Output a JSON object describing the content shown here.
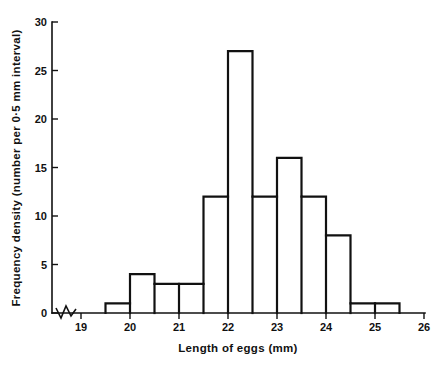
{
  "chart_data": {
    "type": "bar",
    "title": "",
    "subtitle": "",
    "xlabel": "Length of eggs (mm)",
    "ylabel": "Frequency density (number per 0·5 mm interval)",
    "bin_width": 0.5,
    "categories": [
      "19.5-20.0",
      "20.0-20.5",
      "20.5-21.0",
      "21.0-21.5",
      "21.5-22.0",
      "22.0-22.5",
      "22.5-23.0",
      "23.0-23.5",
      "23.5-24.0",
      "24.0-24.5",
      "24.5-25.0",
      "25.0-25.5"
    ],
    "bin_edges": [
      19.5,
      20.0,
      20.5,
      21.0,
      21.5,
      22.0,
      22.5,
      23.0,
      23.5,
      24.0,
      24.5,
      25.0,
      25.5
    ],
    "values": [
      1,
      4,
      3,
      3,
      12,
      27,
      12,
      16,
      12,
      8,
      1,
      1
    ],
    "xlim": [
      19,
      26
    ],
    "ylim": [
      0,
      30
    ],
    "xticks": [
      19,
      20,
      21,
      22,
      23,
      24,
      25,
      26
    ],
    "xtick_labels": [
      "19",
      "20",
      "21",
      "22",
      "23",
      "24",
      "25",
      "26"
    ],
    "yticks": [
      0,
      5,
      10,
      15,
      20,
      25,
      30
    ],
    "ytick_labels": [
      "0",
      "5",
      "10",
      "15",
      "20",
      "25",
      "30"
    ],
    "grid": false,
    "legend": null,
    "axis_break": {
      "present": true,
      "axis": "x",
      "between": [
        0,
        19
      ],
      "style": "zigzag"
    },
    "colors": {
      "line": "#111111",
      "fill": "#ffffff",
      "background": "#ffffff"
    }
  }
}
